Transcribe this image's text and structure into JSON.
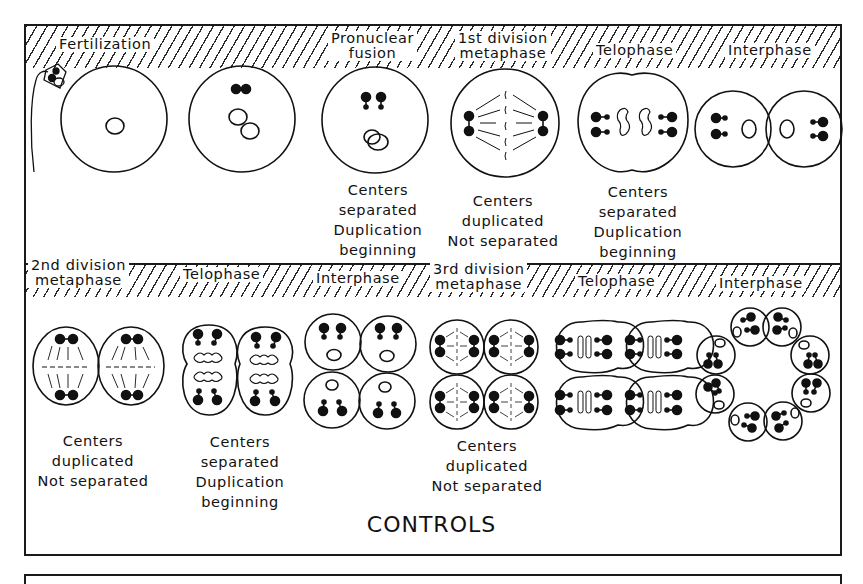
{
  "figure": {
    "title": "CONTROLS",
    "rows": [
      {
        "stages": [
          {
            "label_lines": [
              "Fertilization"
            ],
            "caption_lines": []
          },
          {
            "label_lines": [
              "Pronuclear",
              "fusion"
            ],
            "caption_lines": [
              "Centers",
              "separated",
              "Duplication",
              "beginning"
            ]
          },
          {
            "label_lines": [
              "1st division",
              "metaphase"
            ],
            "caption_lines": [
              "Centers",
              "duplicated",
              "Not separated"
            ]
          },
          {
            "label_lines": [
              "Telophase"
            ],
            "caption_lines": [
              "Centers",
              "separated",
              "Duplication",
              "beginning"
            ]
          },
          {
            "label_lines": [
              "Interphase"
            ],
            "caption_lines": []
          }
        ]
      },
      {
        "stages": [
          {
            "label_lines": [
              "2nd division",
              "metaphase"
            ],
            "caption_lines": [
              "Centers",
              "duplicated",
              "Not separated"
            ]
          },
          {
            "label_lines": [
              "Telophase"
            ],
            "caption_lines": [
              "Centers",
              "separated",
              "Duplication",
              "beginning"
            ]
          },
          {
            "label_lines": [
              "Interphase"
            ],
            "caption_lines": []
          },
          {
            "label_lines": [
              "3rd division",
              "metaphase"
            ],
            "caption_lines": [
              "Centers",
              "duplicated",
              "Not separated"
            ]
          },
          {
            "label_lines": [
              "Telophase"
            ],
            "caption_lines": []
          },
          {
            "label_lines": [
              "Interphase"
            ],
            "caption_lines": []
          }
        ]
      }
    ]
  },
  "colors": {
    "ink": "#111111",
    "paper": "#ffffff"
  }
}
